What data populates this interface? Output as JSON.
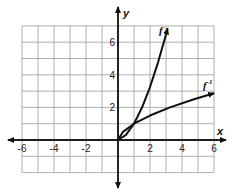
{
  "chart_data": {
    "type": "line",
    "title": "",
    "xlabel": "x",
    "ylabel": "y",
    "xlim": [
      -6,
      6
    ],
    "ylim": [
      -2,
      7
    ],
    "grid": true,
    "x_ticks": [
      "-6",
      "-4",
      "-2",
      "2",
      "4",
      "6"
    ],
    "y_ticks": [
      "2",
      "4",
      "6"
    ],
    "series": [
      {
        "name": "f",
        "label": "f",
        "points": [
          [
            0,
            0
          ],
          [
            0.5,
            0.31
          ],
          [
            1,
            1
          ],
          [
            1.5,
            1.99
          ],
          [
            2,
            3.25
          ],
          [
            2.5,
            4.75
          ],
          [
            3,
            6.47
          ],
          [
            3.1,
            6.85
          ]
        ]
      },
      {
        "name": "f_inverse",
        "label": "f",
        "label_superscript": "-1",
        "points": [
          [
            0,
            0
          ],
          [
            0.31,
            0.5
          ],
          [
            1,
            1
          ],
          [
            2,
            1.5
          ],
          [
            3.25,
            2
          ],
          [
            4.75,
            2.5
          ],
          [
            6,
            2.87
          ]
        ]
      }
    ]
  },
  "labels": {
    "x_axis": "x",
    "y_axis": "y",
    "f": "f",
    "f_inv_base": "f",
    "f_inv_sup": "-1"
  }
}
